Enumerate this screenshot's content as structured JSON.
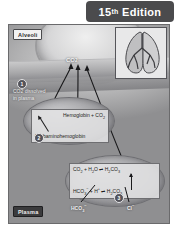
{
  "banner": {
    "edition_number": "15",
    "edition_ordinal": "th",
    "edition_word": "Edition",
    "background_color": "#4b4b4d",
    "text_color": "#ffffff"
  },
  "figure": {
    "labels": {
      "alveoli": "Alveoli",
      "plasma": "Plasma"
    },
    "hub": {
      "species": "CO",
      "species_sub": "2"
    },
    "steps": [
      {
        "number": "1",
        "callout_line1": "CO2 dissolved",
        "callout_line2": "in plasma"
      },
      {
        "number": "2",
        "callout_line1": "",
        "callout_line2": ""
      },
      {
        "number": "3",
        "callout_line1": "",
        "callout_line2": ""
      }
    ],
    "hemoglobin_box": {
      "reactants": "Hemoglobin + CO",
      "reactants_sub": "2",
      "product": "Carbaminohemoglobin"
    },
    "carbonic_box": {
      "line1_left": "CO",
      "line1_left_sub": "2",
      "line1_mid": " + H",
      "line1_mid_sub": "2",
      "line1_mid_end": "O",
      "line1_arrow": "⇌",
      "line1_right": "H",
      "line1_right_sub": "2",
      "line1_right_end": "CO",
      "line1_right_sub2": "3",
      "line2_left": "HCO",
      "line2_left_sub": "3",
      "line2_left_sup": "−",
      "line2_mid": " + H",
      "line2_mid_sup": "+",
      "line2_arrow": "⇌",
      "line2_right": "H",
      "line2_right_sub": "2",
      "line2_right_end": "CO",
      "line2_right_sub2": "3"
    },
    "ions": {
      "bicarbonate": "HCO",
      "bicarbonate_sub": "3",
      "bicarbonate_sup": "−",
      "chloride": "Cl",
      "chloride_sup": "−"
    },
    "inset": {
      "name": "lung-bronchial-tree-illustration"
    },
    "colors": {
      "plate_background": "#8e8e90",
      "alveolus_fill": "#d6d6d7",
      "rbc_fill": "#a4a4a7",
      "equation_box": "#e2e2e4",
      "arrow": "#1b1b1d"
    }
  }
}
